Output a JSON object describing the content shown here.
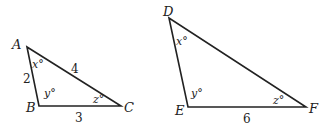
{
  "triangles": [
    {
      "name": "ABC",
      "vertices": {
        "A": {
          "label": "A",
          "x": 27,
          "y": 47
        },
        "B": {
          "label": "B",
          "x": 39,
          "y": 106
        },
        "C": {
          "label": "C",
          "x": 121,
          "y": 106
        }
      },
      "angles": {
        "A": "x°",
        "B": "y°",
        "C": "z°"
      },
      "sides": {
        "AB": "2",
        "AC": "4",
        "BC": "3"
      }
    },
    {
      "name": "DEF",
      "vertices": {
        "D": {
          "label": "D",
          "x": 169,
          "y": 18
        },
        "E": {
          "label": "E",
          "x": 188,
          "y": 107
        },
        "F": {
          "label": "F",
          "x": 306,
          "y": 107
        }
      },
      "angles": {
        "D": "x°",
        "E": "y°",
        "F": "z°"
      },
      "sides": {
        "EF": "6"
      }
    }
  ],
  "colors": {
    "stroke": "#222222",
    "background": "#ffffff"
  }
}
